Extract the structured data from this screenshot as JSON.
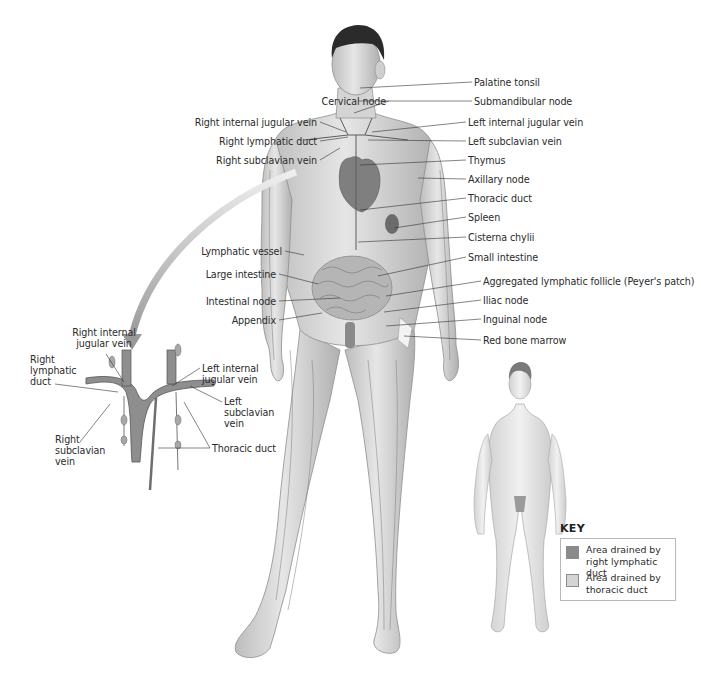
{
  "figure": {
    "main_labels_right": [
      {
        "text": "Palatine tonsil",
        "x": 474,
        "y": 82
      },
      {
        "text": "Submandibular node",
        "x": 474,
        "y": 101
      },
      {
        "text": "Left internal jugular vein",
        "x": 468,
        "y": 122
      },
      {
        "text": "Left subclavian vein",
        "x": 468,
        "y": 141
      },
      {
        "text": "Thymus",
        "x": 468,
        "y": 160
      },
      {
        "text": "Axillary node",
        "x": 468,
        "y": 179
      },
      {
        "text": "Thoracic duct",
        "x": 468,
        "y": 198
      },
      {
        "text": "Spleen",
        "x": 468,
        "y": 217
      },
      {
        "text": "Cisterna chylii",
        "x": 468,
        "y": 237
      },
      {
        "text": "Small intestine",
        "x": 468,
        "y": 257
      },
      {
        "text": "Aggregated lymphatic follicle (Peyer's patch)",
        "x": 483,
        "y": 281
      },
      {
        "text": "Iliac node",
        "x": 483,
        "y": 300
      },
      {
        "text": "Inguinal node",
        "x": 483,
        "y": 319
      },
      {
        "text": "Red bone marrow",
        "x": 483,
        "y": 340
      }
    ],
    "main_labels_left": [
      {
        "text": "Cervical node",
        "right": 386,
        "y": 101
      },
      {
        "text": "Right internal jugular vein",
        "right": 317,
        "y": 122
      },
      {
        "text": "Right lymphatic duct",
        "right": 317,
        "y": 141
      },
      {
        "text": "Right subclavian vein",
        "right": 317,
        "y": 160
      },
      {
        "text": "Lymphatic vessel",
        "right": 282,
        "y": 251
      },
      {
        "text": "Large intestine",
        "right": 276,
        "y": 274
      },
      {
        "text": "Intestinal node",
        "right": 276,
        "y": 301
      },
      {
        "text": "Appendix",
        "right": 276,
        "y": 320
      }
    ],
    "inset_labels": [
      {
        "text": "Right internal jugular vein",
        "x": 68,
        "y": 328,
        "w": 70,
        "align": "center"
      },
      {
        "text": "Right lymphatic duct",
        "x": 30,
        "y": 358,
        "w": 40,
        "align": "left"
      },
      {
        "text": "Left internal jugular vein",
        "x": 202,
        "y": 362,
        "w": 60,
        "align": "left"
      },
      {
        "text": "Left subclavian vein",
        "x": 224,
        "y": 397,
        "w": 44,
        "align": "left"
      },
      {
        "text": "Thoracic duct",
        "x": 212,
        "y": 442,
        "w": 80,
        "align": "left"
      },
      {
        "text": "Right subclavian vein",
        "x": 55,
        "y": 433,
        "w": 46,
        "align": "left"
      }
    ],
    "key": {
      "title": "KEY",
      "items": [
        {
          "text": "Area drained by right lymphatic duct",
          "color": "#8a8a8a"
        },
        {
          "text": "Area drained by thoracic duct",
          "color": "#d4d4d4"
        }
      ]
    }
  }
}
